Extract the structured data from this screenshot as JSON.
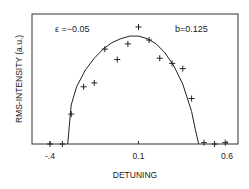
{
  "chart_data": {
    "type": "scatter",
    "title": "",
    "xlabel": "DETUNING",
    "ylabel": "RMS-INTENSITY (a.u.)",
    "xlim": [
      -0.5,
      0.66
    ],
    "ylim": [
      0,
      1.0
    ],
    "x_ticks": [
      -0.4,
      0.1,
      0.6
    ],
    "x_tick_labels": [
      "-.4",
      "0.1",
      "0.6"
    ],
    "grid": false,
    "annotations": [
      {
        "text": "ε =−0.05",
        "position": "top-left"
      },
      {
        "text": "b=0.125",
        "position": "top-right"
      }
    ],
    "series": [
      {
        "name": "measured",
        "marker": "+",
        "x": [
          -0.4,
          -0.33,
          -0.28,
          -0.21,
          -0.15,
          -0.09,
          -0.02,
          0.04,
          0.1,
          0.16,
          0.22,
          0.29,
          0.35,
          0.4,
          0.47,
          0.53,
          0.59
        ],
        "y": [
          0.0,
          0.0,
          0.23,
          0.44,
          0.47,
          0.73,
          0.65,
          0.77,
          0.9,
          0.8,
          0.66,
          0.62,
          0.58,
          0.35,
          0.01,
          0.0,
          0.01
        ]
      },
      {
        "name": "theory",
        "style": "line",
        "x": [
          -0.3,
          -0.28,
          -0.25,
          -0.2,
          -0.15,
          -0.1,
          -0.05,
          0.0,
          0.05,
          0.1,
          0.15,
          0.2,
          0.25,
          0.3,
          0.35,
          0.4,
          0.42,
          0.44
        ],
        "y": [
          0.0,
          0.3,
          0.44,
          0.57,
          0.66,
          0.73,
          0.78,
          0.81,
          0.83,
          0.83,
          0.81,
          0.77,
          0.7,
          0.6,
          0.46,
          0.25,
          0.12,
          0.0
        ]
      }
    ]
  }
}
